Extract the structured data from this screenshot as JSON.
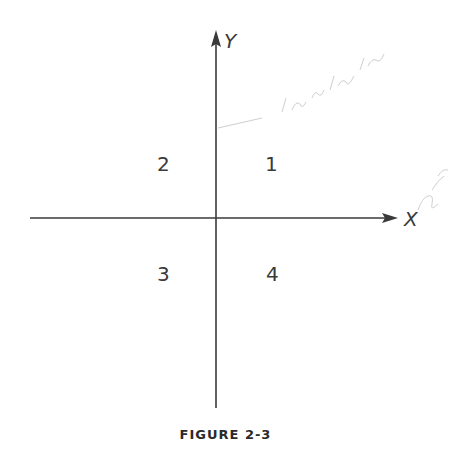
{
  "figure": {
    "caption": "FIGURE 2-3",
    "axes": {
      "x_label": "X",
      "y_label": "Y"
    },
    "quadrants": [
      {
        "id": 1,
        "label": "1"
      },
      {
        "id": 2,
        "label": "2"
      },
      {
        "id": 3,
        "label": "3"
      },
      {
        "id": 4,
        "label": "4"
      }
    ],
    "colors": {
      "ink": "#3a3a3a",
      "pencil_annotation": "#c8c8c8",
      "background": "#ffffff"
    }
  }
}
